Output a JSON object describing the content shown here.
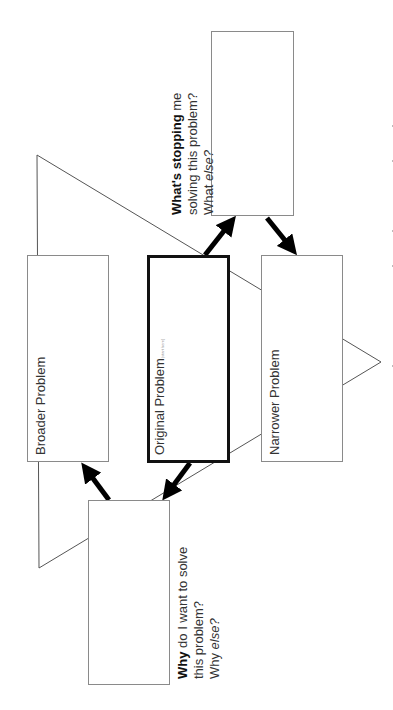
{
  "diagram": {
    "title_boxes": {
      "broader": "Broader Problem",
      "original": "Original Problem",
      "original_note": "(start here)",
      "narrower": "Narrower Problem"
    },
    "prompts": {
      "stopping": {
        "bold": "What's stopping",
        "line1_rest": " me",
        "line2": "solving this problem?",
        "line3_prefix": "What ",
        "line3_italic": "else?"
      },
      "why": {
        "bold": "Why",
        "line1_rest": " do I want to solve",
        "line2": "this problem?",
        "line3_prefix": "Why ",
        "line3_italic": "else?"
      }
    },
    "arrows": [
      {
        "from": "original",
        "to": "stopping"
      },
      {
        "from": "stopping",
        "to": "narrower"
      },
      {
        "from": "original",
        "to": "why"
      },
      {
        "from": "why",
        "to": "broader"
      }
    ],
    "colors": {
      "border": "#8a8a8a",
      "emphasis": "#111111",
      "text": "#333333"
    }
  }
}
